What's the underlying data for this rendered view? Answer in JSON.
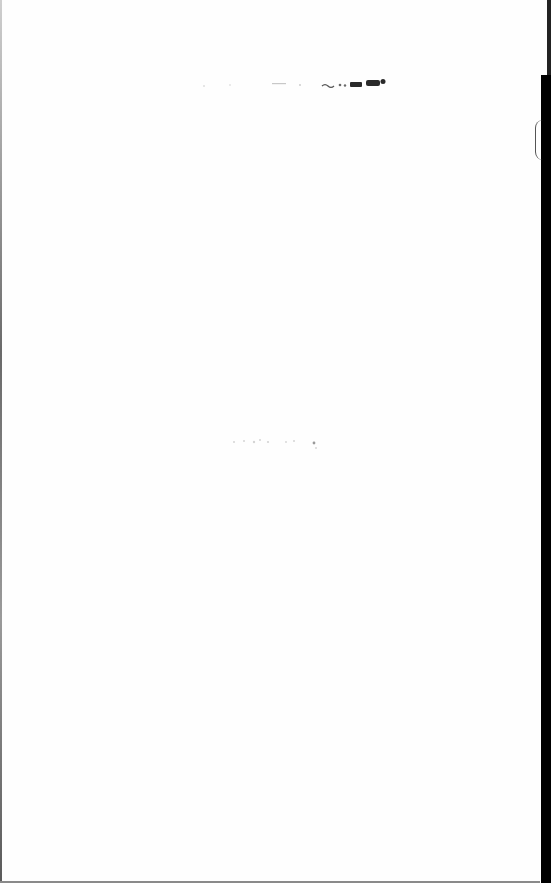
{
  "document": {
    "type": "scanned-page",
    "content": "blank page",
    "visible_text": [],
    "marks": [
      {
        "kind": "bleed-through-smudge",
        "position": "top-center"
      },
      {
        "kind": "faint-specks",
        "position": "center"
      }
    ]
  },
  "colors": {
    "paper": "#fefefe",
    "ink": "#1a1a1a",
    "scan_edge": "#000000"
  }
}
